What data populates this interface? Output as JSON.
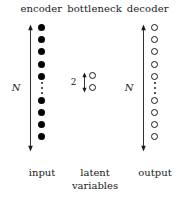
{
  "figure": {
    "type": "autoencoder-architecture-diagram",
    "background_color": "#ffffff",
    "foreground_color": "#1a1a1a"
  },
  "stage_headings": {
    "encoder": "encoder",
    "bottleneck": "bottleneck",
    "decoder": "decoder"
  },
  "captions": {
    "encoder": "input",
    "bottleneck": "latent\nvariables",
    "decoder": "output"
  },
  "dimension_labels": {
    "encoder": "N",
    "bottleneck": "2",
    "decoder": "N"
  },
  "layers": [
    {
      "name": "input",
      "stage": "encoder",
      "node_style": "filled",
      "node_color": "#000000",
      "size_label": "N",
      "nodes_top": 5,
      "nodes_bottom": 4,
      "ellipsis": true
    },
    {
      "name": "latent-variables",
      "stage": "bottleneck",
      "node_style": "open",
      "node_color": "#ffffff",
      "size_label": "2",
      "nodes_top": 2,
      "nodes_bottom": 0,
      "ellipsis": false
    },
    {
      "name": "output",
      "stage": "decoder",
      "node_style": "open",
      "node_color": "#ffffff",
      "size_label": "N",
      "nodes_top": 5,
      "nodes_bottom": 4,
      "ellipsis": true
    }
  ]
}
